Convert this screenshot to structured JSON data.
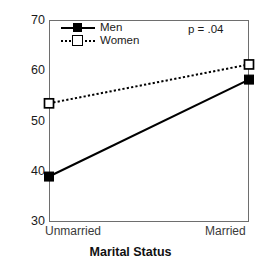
{
  "chart_data": {
    "type": "line",
    "title": "",
    "xlabel": "Marital Status",
    "ylabel": "Percentage Expectation to Never Move",
    "categories": [
      "Unmarried",
      "Married"
    ],
    "series": [
      {
        "name": "Men",
        "values": [
          39.0,
          58.2
        ],
        "marker": "filled-square",
        "linestyle": "solid",
        "color": "#000000"
      },
      {
        "name": "Women",
        "values": [
          53.5,
          61.2
        ],
        "marker": "open-square",
        "linestyle": "dotted",
        "color": "#000000"
      }
    ],
    "ylim": [
      30,
      70
    ],
    "yticks": [
      30,
      40,
      50,
      60,
      70
    ],
    "ytick_labels": [
      "30",
      "40",
      "50",
      "60",
      "70"
    ],
    "xlim": [
      0,
      1
    ],
    "grid": false,
    "legend_position": "top-left",
    "annotations": [
      {
        "name": "p-value",
        "text": "p = .04",
        "position": "top-right"
      }
    ]
  },
  "axis": {
    "ytick_labels": [
      "70",
      "60",
      "50",
      "40",
      "30"
    ],
    "xtick_labels": [
      "Unmarried",
      "Married"
    ],
    "ylabel": "Percentage Expectation to Never Move",
    "xlabel": "Marital Status"
  },
  "legend": {
    "items": [
      {
        "label": "Men",
        "marker": "filled-square-icon",
        "line": "solid-line-icon"
      },
      {
        "label": "Women",
        "marker": "open-square-icon",
        "line": "dotted-line-icon"
      }
    ]
  },
  "annotation": {
    "p_value": "p = .04"
  },
  "colors": {
    "men": "#000000",
    "women": "#000000",
    "frame": "#6e6e6e",
    "background": "#ffffff",
    "text": "#1a1a1a"
  }
}
